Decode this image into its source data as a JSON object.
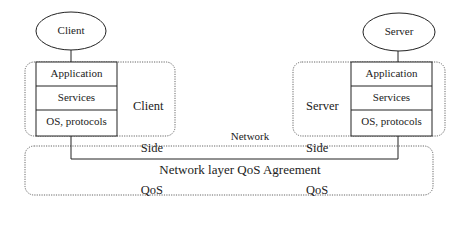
{
  "client": {
    "title": "Client",
    "layers": [
      "Application",
      "Services",
      "OS, protocols"
    ],
    "qos_label": [
      "Client",
      "Side",
      "QoS"
    ]
  },
  "server": {
    "title": "Server",
    "layers": [
      "Application",
      "Services",
      "OS, protocols"
    ],
    "qos_label": [
      "Server",
      "Side",
      "QoS"
    ]
  },
  "network": {
    "label": "Network",
    "agreement_label": "Network layer QoS Agreement"
  }
}
